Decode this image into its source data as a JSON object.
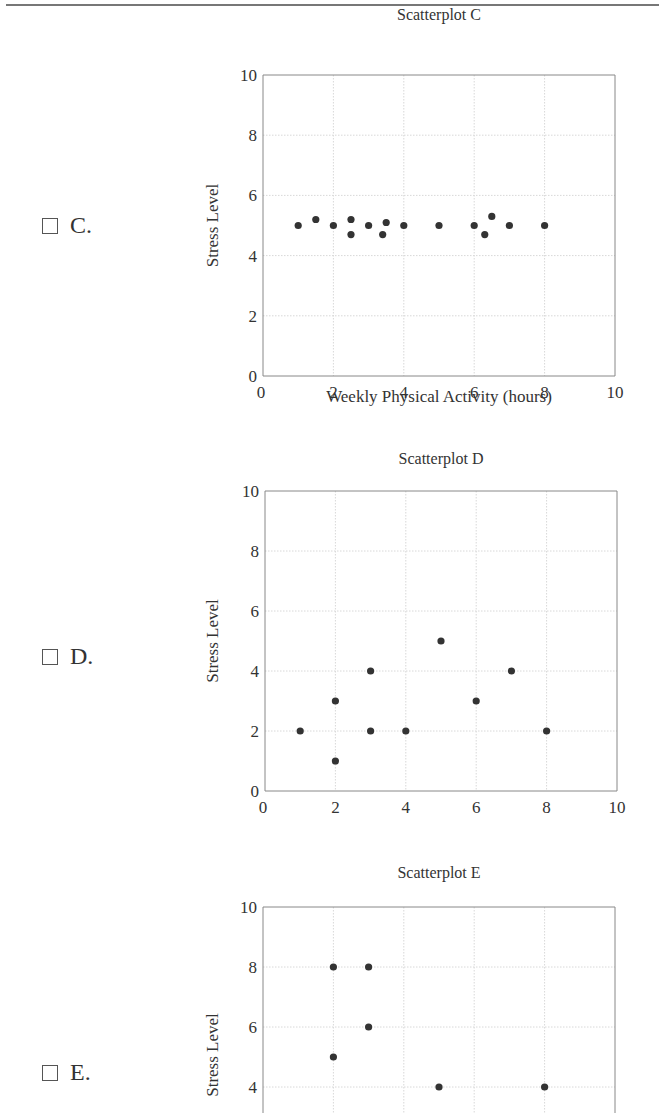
{
  "options": [
    {
      "letter": "C.",
      "label": "C."
    },
    {
      "letter": "D.",
      "label": "D."
    },
    {
      "letter": "E.",
      "label": "E."
    }
  ],
  "chart_data": [
    {
      "type": "scatter",
      "title": "Scatterplot C",
      "xlabel": "Weekly Physical Activity (hours)",
      "ylabel": "Stress Level",
      "xlim": [
        0,
        10
      ],
      "ylim": [
        0,
        10
      ],
      "xticks": [
        0,
        2,
        4,
        6,
        8,
        10
      ],
      "yticks": [
        0,
        2,
        4,
        6,
        8,
        10
      ],
      "grid": true,
      "points": [
        [
          1,
          5
        ],
        [
          1.5,
          5.2
        ],
        [
          2,
          5
        ],
        [
          2.5,
          5.2
        ],
        [
          2.5,
          4.7
        ],
        [
          3,
          5
        ],
        [
          3.4,
          4.7
        ],
        [
          3.5,
          5.1
        ],
        [
          4,
          5
        ],
        [
          5,
          5
        ],
        [
          6,
          5
        ],
        [
          6.3,
          4.7
        ],
        [
          6.5,
          5.3
        ],
        [
          7,
          5
        ],
        [
          8,
          5
        ]
      ]
    },
    {
      "type": "scatter",
      "title": "Scatterplot D",
      "xlabel": "Weekly Physical Activity (hours)",
      "ylabel": "Stress Level",
      "xlim": [
        0,
        10
      ],
      "ylim": [
        0,
        10
      ],
      "xticks": [
        0,
        2,
        4,
        6,
        8,
        10
      ],
      "yticks": [
        0,
        2,
        4,
        6,
        8,
        10
      ],
      "grid": true,
      "points": [
        [
          1,
          2
        ],
        [
          2,
          3
        ],
        [
          2,
          1
        ],
        [
          3,
          4
        ],
        [
          3,
          2
        ],
        [
          4,
          2
        ],
        [
          5,
          5
        ],
        [
          6,
          3
        ],
        [
          7,
          4
        ],
        [
          8,
          2
        ]
      ]
    },
    {
      "type": "scatter",
      "title": "Scatterplot E",
      "xlabel": "",
      "ylabel": "Stress Level",
      "xlim": [
        0,
        10
      ],
      "ylim": [
        0,
        10
      ],
      "xticks": [
        0,
        2,
        4,
        6,
        8,
        10
      ],
      "yticks": [
        4,
        6,
        8,
        10
      ],
      "grid": true,
      "points": [
        [
          2,
          8
        ],
        [
          3,
          8
        ],
        [
          3,
          6
        ],
        [
          2,
          5
        ],
        [
          5,
          4
        ],
        [
          8,
          4
        ]
      ]
    }
  ]
}
